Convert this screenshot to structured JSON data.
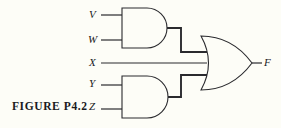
{
  "figure": {
    "caption": "FIGURE  P4.2",
    "background_color": "#fdfdf7",
    "line_color": "#2a2a2e"
  },
  "circuit": {
    "type": "logic-diagram",
    "expression": "F = (V AND W) OR X OR (Y AND Z)",
    "inputs": [
      {
        "id": "V",
        "label": "V"
      },
      {
        "id": "W",
        "label": "W"
      },
      {
        "id": "X",
        "label": "X"
      },
      {
        "id": "Y",
        "label": "Y"
      },
      {
        "id": "Z",
        "label": "Z"
      }
    ],
    "outputs": [
      {
        "id": "F",
        "label": "F"
      }
    ],
    "gates": [
      {
        "id": "and-top",
        "type": "AND",
        "inputs": [
          "V",
          "W"
        ],
        "output": "VW"
      },
      {
        "id": "and-bottom",
        "type": "AND",
        "inputs": [
          "Y",
          "Z"
        ],
        "output": "YZ"
      },
      {
        "id": "or-main",
        "type": "OR",
        "inputs": [
          "VW",
          "X",
          "YZ"
        ],
        "output": "F"
      }
    ]
  }
}
